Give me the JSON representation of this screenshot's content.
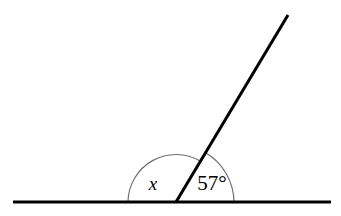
{
  "figure": {
    "name": "angles-on-a-straight-line-diagram",
    "background_color": "#ffffff",
    "width": 341,
    "height": 216
  },
  "style": {
    "line_color": "#000000",
    "line_width": 3,
    "arc_color": "#6e6e6e",
    "arc_width": 1.2
  },
  "geometry": {
    "vertex": {
      "x": 176,
      "y": 202
    },
    "baseline": {
      "name": "horizontal-straight-line",
      "x1": 13,
      "y1": 202,
      "x2": 331,
      "y2": 202
    },
    "ray": {
      "name": "oblique-ray",
      "x1": 176,
      "y1": 202,
      "x2": 288,
      "y2": 15
    },
    "arc_left": {
      "name": "unknown-angle-arc",
      "radius": 48,
      "start_x": 128,
      "start_y": 202,
      "end_x": 200.6,
      "end_y": 161.3
    },
    "arc_right": {
      "name": "known-angle-arc",
      "radius": 58,
      "start_x": 205.7,
      "start_y": 152.8,
      "end_x": 234,
      "end_y": 202
    }
  },
  "labels": {
    "unknown_angle": {
      "text": "x",
      "x": 153,
      "y": 186
    },
    "known_angle": {
      "text": "57°",
      "x": 212,
      "y": 185
    }
  }
}
